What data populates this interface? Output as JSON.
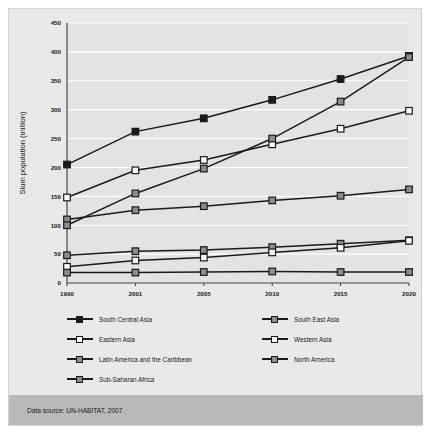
{
  "footer": {
    "source_text": "Data source: UN-HABITAT, 2007"
  },
  "chart_data": {
    "type": "line",
    "title": "",
    "xlabel": "",
    "ylabel": "Slum population (million)",
    "categories": [
      "1990",
      "2001",
      "2005",
      "2010",
      "2015",
      "2020"
    ],
    "ylim": [
      0,
      450
    ],
    "yticks": [
      0,
      50,
      100,
      150,
      200,
      250,
      300,
      350,
      400,
      450
    ],
    "grid": true,
    "legend_position": "below",
    "series": [
      {
        "name": "South Central Asia",
        "marker": "filled-square",
        "color": "#1a1a1a",
        "fill": "#1a1a1a",
        "values": [
          205,
          262,
          285,
          317,
          353,
          393
        ]
      },
      {
        "name": "South East Asia",
        "marker": "gray-square",
        "color": "#1a1a1a",
        "fill": "#8c8c8c",
        "values": [
          48,
          55,
          57,
          62,
          68,
          74
        ]
      },
      {
        "name": "Eastern Asia",
        "marker": "open-square",
        "color": "#1a1a1a",
        "fill": "#ffffff",
        "values": [
          148,
          195,
          213,
          240,
          267,
          298
        ]
      },
      {
        "name": "Western Asia",
        "marker": "open-square",
        "color": "#1a1a1a",
        "fill": "#ffffff",
        "values": [
          28,
          39,
          44,
          53,
          61,
          73
        ]
      },
      {
        "name": "Latin America and the Caribbean",
        "marker": "gray-square",
        "color": "#1a1a1a",
        "fill": "#8c8c8c",
        "values": [
          110,
          126,
          133,
          143,
          151,
          162
        ]
      },
      {
        "name": "North America",
        "marker": "gray-square",
        "color": "#1a1a1a",
        "fill": "#8c8c8c",
        "values": [
          18,
          18,
          19,
          20,
          19,
          19
        ]
      },
      {
        "name": "Sub-Saharan Africa",
        "marker": "gray-square",
        "color": "#1a1a1a",
        "fill": "#8c8c8c",
        "values": [
          100,
          155,
          198,
          250,
          314,
          391
        ]
      }
    ],
    "legend_layout": [
      [
        "South Central Asia",
        "South East Asia"
      ],
      [
        "Eastern Asia",
        "Western Asia"
      ],
      [
        "Latin America and the Caribbean",
        "North America"
      ],
      [
        "Sub-Saharan Africa",
        null
      ]
    ]
  }
}
